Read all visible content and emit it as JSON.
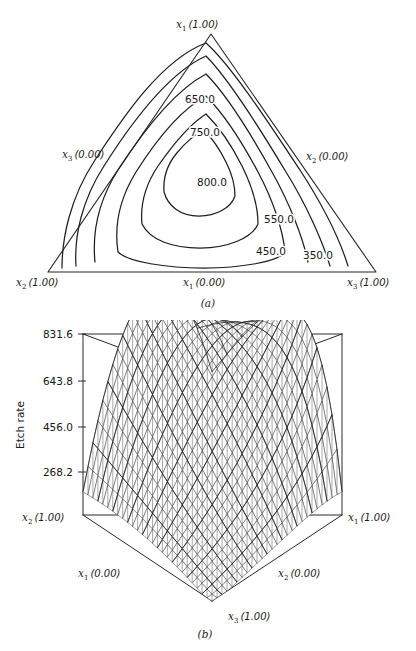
{
  "figure": {
    "background_color": "#ffffff",
    "ink_color": "#1f1f1f"
  },
  "panel_a": {
    "caption": "(a)",
    "vertex_labels": {
      "apex": {
        "var": "x",
        "sub": "1",
        "value": "(1.00)",
        "full": "x1 (1.00)"
      },
      "bottom_left": {
        "var": "x",
        "sub": "2",
        "value": "(1.00)",
        "full": "x2 (1.00)"
      },
      "bottom_right": {
        "var": "x",
        "sub": "3",
        "value": "(1.00)",
        "full": "x3 (1.00)"
      }
    },
    "edge_labels": {
      "left": {
        "var": "x",
        "sub": "3",
        "value": "(0.00)",
        "full": "x3 (0.00)"
      },
      "right": {
        "var": "x",
        "sub": "2",
        "value": "(0.00)",
        "full": "x2 (0.00)"
      },
      "bottom": {
        "var": "x",
        "sub": "1",
        "value": "(0.00)",
        "full": "x1 (0.00)"
      }
    },
    "contour_labels": [
      {
        "text": "650.0",
        "x": 200,
        "y": 103
      },
      {
        "text": "750.0",
        "x": 205,
        "y": 136
      },
      {
        "text": "800.0",
        "x": 212,
        "y": 186
      },
      {
        "text": "550.0",
        "x": 279,
        "y": 223
      },
      {
        "text": "450.0",
        "x": 271,
        "y": 255
      },
      {
        "text": "350.0",
        "x": 318,
        "y": 259
      }
    ]
  },
  "panel_b": {
    "caption": "(b)",
    "z_axis_title": "Etch rate",
    "z_ticks": [
      {
        "label": "831.6",
        "y": 338
      },
      {
        "label": "643.8",
        "y": 381
      },
      {
        "label": "456.0",
        "y": 427
      },
      {
        "label": "268.2",
        "y": 472
      }
    ],
    "corner_labels": {
      "left": {
        "var": "x",
        "sub": "2",
        "value": "(1.00)",
        "full": "x2 (1.00)"
      },
      "right": {
        "var": "x",
        "sub": "1",
        "value": "(1.00)",
        "full": "x1 (1.00)"
      },
      "front_left": {
        "var": "x",
        "sub": "1",
        "value": "(0.00)",
        "full": "x1 (0.00)"
      },
      "front_right": {
        "var": "x",
        "sub": "2",
        "value": "(0.00)",
        "full": "x2 (0.00)"
      },
      "front": {
        "var": "x",
        "sub": "3",
        "value": "(1.00)",
        "full": "x3 (1.00)"
      }
    }
  },
  "chart_data": [
    {
      "type": "contour",
      "panel": "(a)",
      "title": "",
      "coordinate_system": "ternary-simplex",
      "components": [
        "x1",
        "x2",
        "x3"
      ],
      "vertices": {
        "x1": {
          "position": "apex",
          "value": 1.0
        },
        "x2": {
          "position": "bottom-left",
          "value": 1.0
        },
        "x3": {
          "position": "bottom-right",
          "value": 1.0
        }
      },
      "edges": {
        "left_edge": "x3 (0.00)",
        "right_edge": "x2 (0.00)",
        "bottom_edge": "x1 (0.00)"
      },
      "response_variable": "Etch rate",
      "contour_levels": [
        350.0,
        450.0,
        550.0,
        650.0,
        750.0,
        800.0
      ],
      "level_labels": [
        "350.0",
        "450.0",
        "550.0",
        "650.0",
        "750.0",
        "800.0"
      ],
      "maximum_interior": 800.0,
      "maximum_location_note": "interior of simplex, shifted toward the x1/x2 side",
      "grid": false,
      "legend": "none"
    },
    {
      "type": "surface",
      "panel": "(b)",
      "title": "",
      "xlabel": "",
      "ylabel": "",
      "zlabel": "Etch rate",
      "zticks": [
        268.2,
        456.0,
        643.8,
        831.6
      ],
      "zlim": [
        268.2,
        831.6
      ],
      "base_shape": "rotated-square (simplex projection)",
      "base_corner_labels": {
        "left": "x2 (1.00)",
        "right": "x1 (1.00)",
        "front_left_edge": "x1 (0.00)",
        "front_right_edge": "x2 (0.00)",
        "front": "x3 (1.00)"
      },
      "surface_description": "dome-shaped response surface, peak near the back, falling steeply to the front x3 (1.00) corner",
      "peak_value": 831.6,
      "min_value": 268.2,
      "mesh": "triangular wireframe",
      "grid": false,
      "legend": "none"
    }
  ]
}
